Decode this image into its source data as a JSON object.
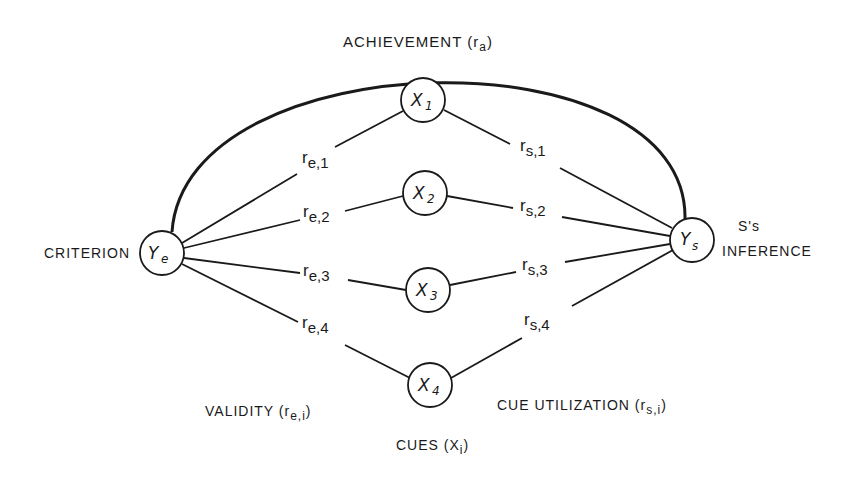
{
  "diagram": {
    "title": "ACHIEVEMENT (ra)",
    "achievement_label": "ACHIEVEMENT",
    "achievement_symbol": "(r",
    "achievement_sub": "a",
    "achievement_close": ")",
    "criterion_label": "CRITERION",
    "inference_label_1": "S's",
    "inference_label_2": "INFERENCE",
    "validity_label": "VALIDITY (r",
    "validity_sub": "e,i",
    "validity_close": ")",
    "cue_util_label": "CUE  UTILIZATION (r",
    "cue_util_sub": "s,i",
    "cue_util_close": ")",
    "cues_label": "CUES (X",
    "cues_sub": "i",
    "cues_close": ")",
    "nodes": {
      "criterion": {
        "main": "Y",
        "sub": "e"
      },
      "inference": {
        "main": "Y",
        "sub": "s"
      },
      "cues": [
        {
          "main": "X",
          "sub": "1"
        },
        {
          "main": "X",
          "sub": "2"
        },
        {
          "main": "X",
          "sub": "3"
        },
        {
          "main": "X",
          "sub": "4"
        }
      ]
    },
    "validity_edges": [
      {
        "r": "r",
        "sub": "e,1"
      },
      {
        "r": "r",
        "sub": "e,2"
      },
      {
        "r": "r",
        "sub": "e,3"
      },
      {
        "r": "r",
        "sub": "e,4"
      }
    ],
    "utilization_edges": [
      {
        "r": "r",
        "sub": "s,1"
      },
      {
        "r": "r",
        "sub": "s,2"
      },
      {
        "r": "r",
        "sub": "s,3"
      },
      {
        "r": "r",
        "sub": "s,4"
      }
    ],
    "line_color": "#1a1a1a"
  }
}
